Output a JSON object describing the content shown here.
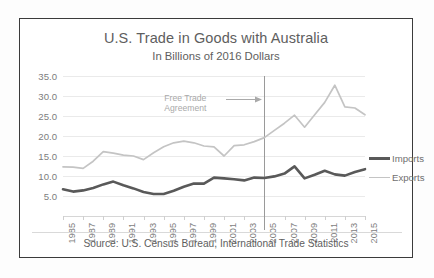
{
  "chart_data": {
    "type": "line",
    "title": "U.S. Trade in Goods with Australia",
    "subtitle": "In Billions of 2016 Dollars",
    "xlabel": "",
    "ylabel": "",
    "ylim": [
      0,
      35
    ],
    "yticks": [
      5,
      10,
      15,
      20,
      25,
      30,
      35
    ],
    "ytick_labels": [
      "5.0",
      "10.0",
      "15.0",
      "20.0",
      "25.0",
      "30.0",
      "35.0"
    ],
    "grid": true,
    "legend_position": "right",
    "x": [
      1985,
      1986,
      1987,
      1988,
      1989,
      1990,
      1991,
      1992,
      1993,
      1994,
      1995,
      1996,
      1997,
      1998,
      1999,
      2000,
      2001,
      2002,
      2003,
      2004,
      2005,
      2006,
      2007,
      2008,
      2009,
      2010,
      2011,
      2012,
      2013,
      2014,
      2015
    ],
    "xtick_labels": [
      "1985",
      "1987",
      "1989",
      "1991",
      "1993",
      "1995",
      "1997",
      "1999",
      "2001",
      "2003",
      "2005",
      "2007",
      "2009",
      "2011",
      "2013",
      "2015"
    ],
    "series": [
      {
        "name": "Imports",
        "color": "#595959",
        "width": 2.6,
        "values": [
          6.7,
          6.1,
          6.4,
          7.0,
          7.9,
          8.6,
          7.7,
          6.9,
          6.0,
          5.5,
          5.5,
          6.3,
          7.3,
          8.1,
          8.1,
          9.6,
          9.4,
          9.2,
          8.9,
          9.6,
          9.5,
          9.9,
          10.6,
          12.4,
          9.4,
          10.3,
          11.3,
          10.4,
          10.1,
          11.0,
          11.7
        ]
      },
      {
        "name": "Exports",
        "color": "#c4c4c4",
        "width": 1.7,
        "values": [
          12.3,
          12.2,
          11.9,
          13.7,
          16.1,
          15.7,
          15.2,
          15.0,
          14.1,
          15.8,
          17.3,
          18.3,
          18.7,
          18.3,
          17.5,
          17.3,
          15.0,
          17.6,
          17.8,
          18.6,
          19.6,
          21.4,
          23.2,
          25.2,
          22.2,
          25.3,
          28.4,
          32.7,
          27.3,
          27.0,
          25.3
        ]
      }
    ],
    "annotations": [
      {
        "text_line1": "Free Trade",
        "text_line2": "Agreement",
        "arrow": true,
        "reference_line_x": 2005
      }
    ],
    "source": "Source: U.S. Census Bureau, International Trade Statistics"
  },
  "legend": {
    "items": [
      {
        "label": "Imports"
      },
      {
        "label": "Exports"
      }
    ]
  }
}
